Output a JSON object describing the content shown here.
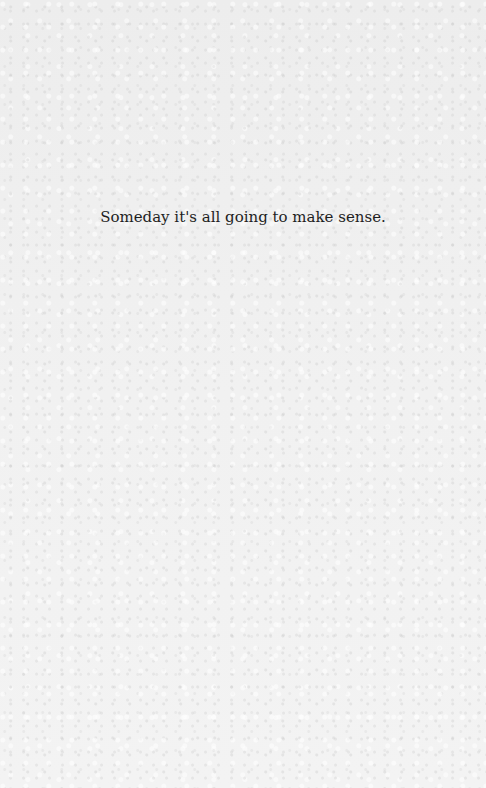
{
  "page": {
    "epigraph": "Someday it's all going to make sense."
  },
  "colors": {
    "background": "#eeeeee",
    "text": "#1e1e1e"
  }
}
